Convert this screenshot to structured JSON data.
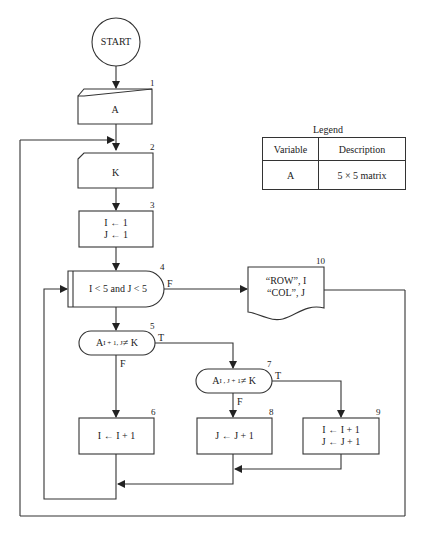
{
  "diagram": {
    "type": "flowchart",
    "nodes": [
      {
        "id": "start",
        "shape": "circle",
        "text": "START"
      },
      {
        "id": "1",
        "shape": "manual-input",
        "text": "A"
      },
      {
        "id": "2",
        "shape": "manual-input",
        "text": "K"
      },
      {
        "id": "3",
        "shape": "process",
        "lines": [
          "I ← 1",
          "J ← 1"
        ]
      },
      {
        "id": "4",
        "shape": "loop-decision",
        "text": "I < 5  and J < 5",
        "branch_false": "F"
      },
      {
        "id": "5",
        "shape": "decision",
        "text_main": "A",
        "text_sub": "I + 1, J",
        "text_rest": " ≠ K",
        "branch_true": "T",
        "branch_false": "F"
      },
      {
        "id": "6",
        "shape": "process",
        "text": "I ← I + 1"
      },
      {
        "id": "7",
        "shape": "decision",
        "text_main": "A",
        "text_sub": "I , J + 1",
        "text_rest": " ≠ K",
        "branch_true": "T",
        "branch_false": "F"
      },
      {
        "id": "8",
        "shape": "process",
        "text": "J ← J + 1"
      },
      {
        "id": "9",
        "shape": "process",
        "lines": [
          "I ← I + 1",
          "J ← J + 1"
        ]
      },
      {
        "id": "10",
        "shape": "document-output",
        "lines": [
          "“ROW”, I",
          "“COL”, J"
        ]
      }
    ],
    "numbers": {
      "n1": "1",
      "n2": "2",
      "n3": "3",
      "n4": "4",
      "n5": "5",
      "n6": "6",
      "n7": "7",
      "n8": "8",
      "n9": "9",
      "n10": "10"
    }
  },
  "legend": {
    "title": "Legend",
    "headers": [
      "Variable",
      "Description"
    ],
    "rows": [
      [
        "A",
        "5 × 5 matrix"
      ]
    ]
  }
}
